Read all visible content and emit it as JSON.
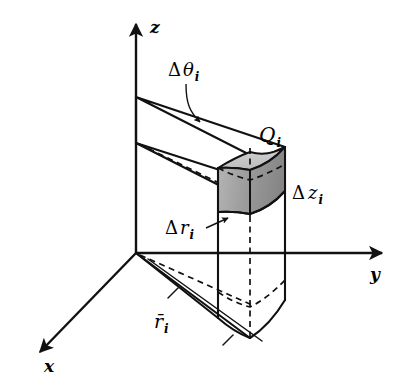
{
  "figure": {
    "background_color": "#ffffff",
    "line_color": "#111111"
  },
  "axes": [
    {
      "id": "z",
      "label": "z",
      "label_x": 150,
      "label_y": 33,
      "direction": "up"
    },
    {
      "id": "y",
      "label": "y",
      "label_x": 370,
      "label_y": 280,
      "direction": "right"
    },
    {
      "id": "x",
      "label": "x",
      "label_x": 44,
      "label_y": 372,
      "direction": "down-left"
    }
  ],
  "annotations": [
    {
      "id": "delta-theta",
      "symbol": "Δ",
      "variable": "θ",
      "subscript": "i",
      "x": 168,
      "y": 76,
      "has_leader": true
    },
    {
      "id": "q-i",
      "symbol": "",
      "variable": "Q",
      "subscript": "i",
      "x": 259,
      "y": 142,
      "has_leader": false
    },
    {
      "id": "delta-z",
      "symbol": "Δ",
      "variable": "z",
      "subscript": "i",
      "x": 292,
      "y": 199,
      "has_leader": false
    },
    {
      "id": "delta-r",
      "symbol": "Δ",
      "variable": "r",
      "subscript": "i",
      "x": 165,
      "y": 234,
      "has_leader": true
    },
    {
      "id": "r-bar",
      "symbol": "",
      "variable": "r̄",
      "subscript": "i",
      "x": 154,
      "y": 328,
      "has_leader": true
    }
  ],
  "shaded_element": {
    "name": "Q_i",
    "top_face_color": "#c6c6c6",
    "left_face_color": "#a6a6a6",
    "right_face_color": "#8e8e8e"
  }
}
